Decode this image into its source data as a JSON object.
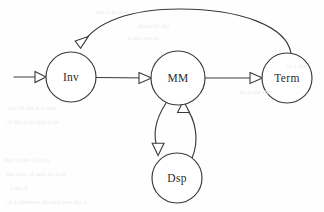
{
  "diagram": {
    "background_color": "#fefefe",
    "stroke_color": "#3a3a3a",
    "node_fill_color": "#ffffff",
    "label_color": "#2b2b2b",
    "arrowhead_style": "open-triangle",
    "nodes": [
      {
        "id": "inv",
        "label": "Inv",
        "cx": 71,
        "cy": 77,
        "r": 25
      },
      {
        "id": "mm",
        "label": "MM",
        "cx": 178,
        "cy": 78,
        "r": 27
      },
      {
        "id": "term",
        "label": "Term",
        "cx": 287,
        "cy": 78,
        "r": 25
      },
      {
        "id": "dsp",
        "label": "Dsp",
        "cx": 177,
        "cy": 178,
        "r": 25
      }
    ],
    "edges": [
      {
        "id": "entry-to-inv",
        "from": "",
        "to": "inv",
        "shape": "straight"
      },
      {
        "id": "inv-to-mm",
        "from": "inv",
        "to": "mm",
        "shape": "straight"
      },
      {
        "id": "mm-to-term",
        "from": "mm",
        "to": "term",
        "shape": "straight"
      },
      {
        "id": "term-to-inv",
        "from": "term",
        "to": "inv",
        "shape": "arc-over-top"
      },
      {
        "id": "mm-to-dsp",
        "from": "mm",
        "to": "dsp",
        "shape": "curve-left"
      },
      {
        "id": "dsp-to-mm",
        "from": "dsp",
        "to": "mm",
        "shape": "curve-right"
      }
    ]
  },
  "bleed_through": [
    {
      "text": "the  a  in  and",
      "x": 96,
      "y": 8
    },
    {
      "text": "most  of  the",
      "x": 138,
      "y": 22
    },
    {
      "text": "a  the  are  in",
      "x": 128,
      "y": 34
    },
    {
      "text": "of  s  the",
      "x": 286,
      "y": 62
    },
    {
      "text": "in  a  not  the",
      "x": 240,
      "y": 88
    },
    {
      "text": "a  e  of  the  n  a  this",
      "x": 8,
      "y": 104
    },
    {
      "text": "of  the  s  in  and  a  ns",
      "x": 6,
      "y": 118
    },
    {
      "text": "that  a  the  of  in  a",
      "x": 4,
      "y": 156
    },
    {
      "text": "the  one  of  and  se  a  ns",
      "x": 6,
      "y": 170
    },
    {
      "text": "a  in  of",
      "x": 10,
      "y": 184
    },
    {
      "text": "of  a  number  should  use  the  a",
      "x": 6,
      "y": 198
    }
  ]
}
